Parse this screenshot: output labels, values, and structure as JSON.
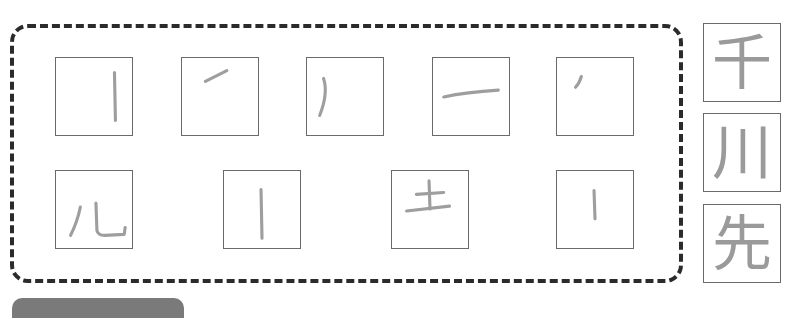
{
  "worksheet": {
    "stroke_boxes": [
      {
        "id": "r1c1",
        "stroke": "vertical line (丨)"
      },
      {
        "id": "r1c2",
        "stroke": "rising flick (㇀)"
      },
      {
        "id": "r1c3",
        "stroke": "left-falling curve (丿)"
      },
      {
        "id": "r1c4",
        "stroke": "horizontal line (一)"
      },
      {
        "id": "r1c5",
        "stroke": "short left-falling dot (丶)"
      },
      {
        "id": "r2c1",
        "stroke": "儿"
      },
      {
        "id": "r2c2",
        "stroke": "vertical line (丨)"
      },
      {
        "id": "r2c3",
        "stroke": "土"
      },
      {
        "id": "r2c4",
        "stroke": "short vertical line (丨)"
      }
    ],
    "answer_kanji": [
      "千",
      "川",
      "先"
    ],
    "colors": {
      "dashed_border": "#2b2b2b",
      "box_border": "#6a6a6a",
      "stroke_gray": "#9e9e9e",
      "tab_gray": "#7a7a7a"
    }
  }
}
